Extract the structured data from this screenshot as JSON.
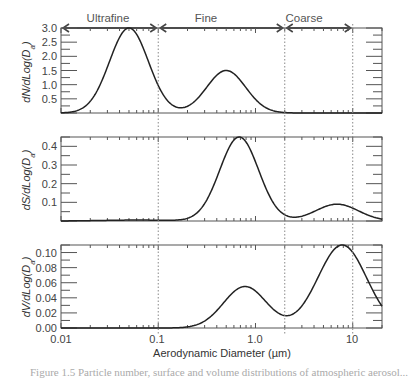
{
  "chart_data": {
    "type": "line",
    "xscale": "log",
    "xlabel": "Aerodynamic Diameter (µm)",
    "xlim": [
      0.01,
      20
    ],
    "xticks": [
      0.01,
      0.1,
      1.0,
      10
    ],
    "xtick_labels": [
      "0.01",
      "0.1",
      "1.0",
      "10"
    ],
    "regions": [
      {
        "label": "Ultrafine",
        "from": 0.01,
        "to": 0.1
      },
      {
        "label": "Fine",
        "from": 0.1,
        "to": 2.0
      },
      {
        "label": "Coarse",
        "from": 2.0,
        "to": 10
      }
    ],
    "region_boundaries": [
      0.1,
      2.0,
      10
    ],
    "panels": [
      {
        "ylabel": "dN/dLog(D_a)",
        "ylabel_main": "dN/dLog(D",
        "ylabel_sub": "a",
        "ylim": [
          0,
          3.0
        ],
        "yticks": [
          0.5,
          1.0,
          1.5,
          2.0,
          2.5,
          3.0
        ],
        "ytick_labels": [
          "0.5",
          "1.0",
          "1.5",
          "2.0",
          "2.5",
          "3.0"
        ],
        "modes": [
          {
            "name": "ultrafine",
            "peak_diameter": 0.05,
            "peak_value": 3.0,
            "log_sigma": 0.2
          },
          {
            "name": "fine",
            "peak_diameter": 0.5,
            "peak_value": 1.5,
            "log_sigma": 0.2
          }
        ],
        "points": [
          [
            0.01,
            0.0
          ],
          [
            0.02,
            0.3
          ],
          [
            0.03,
            1.6
          ],
          [
            0.05,
            3.0
          ],
          [
            0.08,
            1.7
          ],
          [
            0.1,
            0.5
          ],
          [
            0.15,
            0.1
          ],
          [
            0.2,
            0.25
          ],
          [
            0.3,
            0.8
          ],
          [
            0.5,
            1.5
          ],
          [
            0.8,
            0.8
          ],
          [
            1.0,
            0.4
          ],
          [
            2.0,
            0.0
          ],
          [
            10,
            0.0
          ],
          [
            20,
            0.0
          ]
        ]
      },
      {
        "ylabel": "dS/dLog(D_a)",
        "ylabel_main": "dS/dLog(D",
        "ylabel_sub": "a",
        "ylim": [
          0,
          0.45
        ],
        "yticks": [
          0.1,
          0.2,
          0.3,
          0.4
        ],
        "ytick_labels": [
          "0.1",
          "0.2",
          "0.3",
          "0.4"
        ],
        "modes": [
          {
            "name": "ultrafine",
            "peak_diameter": 0.06,
            "peak_value": 0.005,
            "log_sigma": 0.35
          },
          {
            "name": "fine",
            "peak_diameter": 0.68,
            "peak_value": 0.45,
            "log_sigma": 0.2
          },
          {
            "name": "coarse",
            "peak_diameter": 6.9,
            "peak_value": 0.09,
            "log_sigma": 0.22
          }
        ],
        "points": [
          [
            0.01,
            0.0
          ],
          [
            0.05,
            0.005
          ],
          [
            0.1,
            0.005
          ],
          [
            0.3,
            0.07
          ],
          [
            0.5,
            0.32
          ],
          [
            0.68,
            0.45
          ],
          [
            1.0,
            0.3
          ],
          [
            1.5,
            0.05
          ],
          [
            2.5,
            0.005
          ],
          [
            6.9,
            0.09
          ],
          [
            20,
            0.0
          ]
        ]
      },
      {
        "ylabel": "dV/dLog(D_a)",
        "ylabel_main": "dV/dLog(D",
        "ylabel_sub": "a",
        "ylim": [
          0,
          0.11
        ],
        "yticks": [
          0.0,
          0.02,
          0.04,
          0.06,
          0.08,
          0.1
        ],
        "ytick_labels": [
          "0.00",
          "0.02",
          "0.04",
          "0.06",
          "0.08",
          "0.10"
        ],
        "modes": [
          {
            "name": "fine",
            "peak_diameter": 0.78,
            "peak_value": 0.055,
            "log_sigma": 0.22
          },
          {
            "name": "coarse",
            "peak_diameter": 7.8,
            "peak_value": 0.11,
            "log_sigma": 0.25
          }
        ],
        "points": [
          [
            0.01,
            0.0
          ],
          [
            0.1,
            0.0
          ],
          [
            0.3,
            0.012
          ],
          [
            0.78,
            0.055
          ],
          [
            1.5,
            0.02
          ],
          [
            2.3,
            0.003
          ],
          [
            4.0,
            0.05
          ],
          [
            7.8,
            0.11
          ],
          [
            12,
            0.07
          ],
          [
            20,
            0.017
          ]
        ]
      }
    ],
    "grid": false,
    "legend": null
  },
  "caption": "Figure 1.5  Particle number, surface and volume distributions of atmospheric aerosol..."
}
